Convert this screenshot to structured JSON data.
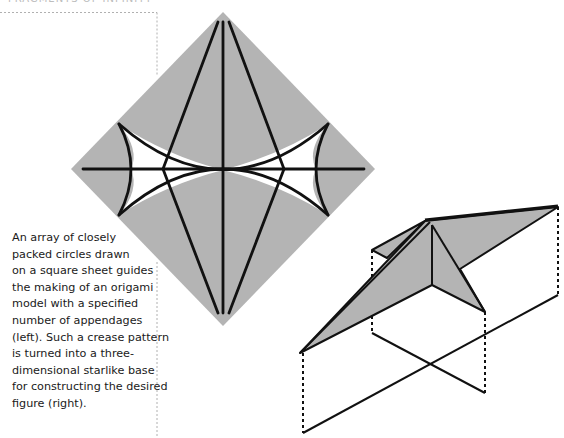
{
  "header": {
    "title": "FRAGMENTS OF INFINITY"
  },
  "caption": {
    "lines": [
      "An array of closely",
      "packed circles drawn",
      "on a square sheet guides",
      "the making of an origami",
      "model with a specified",
      "number of appendages",
      "(left). Such a crease pattern",
      "is turned into a three-",
      "dimensional starlike base",
      "for constructing the desired",
      "figure (right)."
    ]
  },
  "figures": {
    "left": {
      "name": "crease-pattern-diagram",
      "fill": "#b4b4b4",
      "stroke": "#111111"
    },
    "right": {
      "name": "starlike-base-3d-diagram",
      "fill": "#b4b4b4",
      "stroke": "#111111"
    }
  },
  "colors": {
    "divider": "#b0b0b0",
    "text": "#1a1a1a",
    "paper": "#b4b4b4",
    "line": "#111111"
  }
}
